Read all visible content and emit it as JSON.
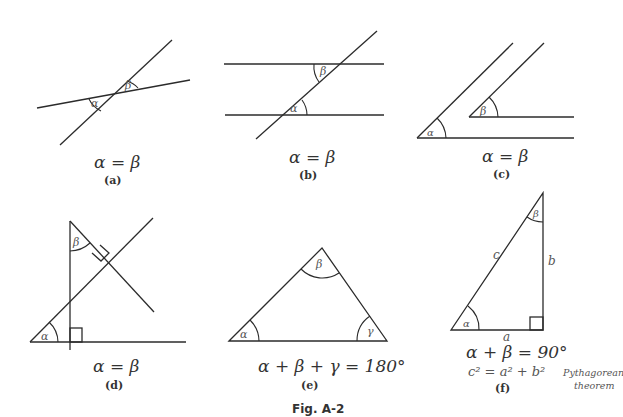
{
  "figure": {
    "caption": "Fig. A-2",
    "panels": [
      {
        "id": "a",
        "label": "(a)",
        "equation": "α = β",
        "angles": [
          "α",
          "β"
        ]
      },
      {
        "id": "b",
        "label": "(b)",
        "equation": "α = β",
        "angles": [
          "α",
          "β"
        ]
      },
      {
        "id": "c",
        "label": "(c)",
        "equation": "α = β",
        "angles": [
          "α",
          "β"
        ]
      },
      {
        "id": "d",
        "label": "(d)",
        "equation": "α = β",
        "angles": [
          "α",
          "β"
        ]
      },
      {
        "id": "e",
        "label": "(e)",
        "equation": "α + β + γ = 180°",
        "angles": [
          "α",
          "β",
          "γ"
        ]
      },
      {
        "id": "f",
        "label": "(f)",
        "equation": "α + β = 90°",
        "equation2": "c² = a² + b²",
        "note_line1": "Pythagorean",
        "note_line2": "theorem",
        "angles": [
          "α",
          "β"
        ],
        "sides": [
          "a",
          "b",
          "c"
        ]
      }
    ]
  }
}
